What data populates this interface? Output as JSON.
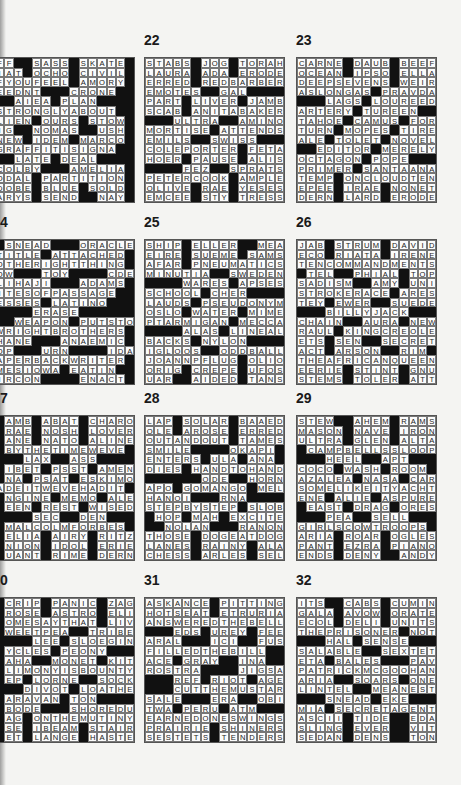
{
  "puzzles": [
    {
      "number": "",
      "num_label": "",
      "x": -6,
      "y": 57,
      "label_x": 2,
      "label_y": 32,
      "rows": [
        "FF##SASS#SKATE",
        "IAT#OCHO#CIVIL",
        "FYOUFEEL#AMORY",
        "EEDNT###CRONE#",
        "##AIEA#PLAN###",
        "STRONGLYABOUT#",
        "LIEN#OURS#STOW",
        "IG##NOMAS##USH",
        "NEW#IDEM#MARCO",
        "GRAFFITISIGNA#",
        "##LATE#DEAL###",
        "COLBY###AMELIA",
        "ODAL#PARTITION",
        "DOBE#BLUE#SOLD",
        "ARYS#SEND##NAY"
      ]
    },
    {
      "number": "22",
      "num_label": "22",
      "x": 144,
      "y": 57,
      "label_x": 144,
      "label_y": 32,
      "rows": [
        "STABS#JOG#TORAH",
        "LAURA#ADA#ERODE",
        "ERRED#REDBARBER",
        "EMOTES##GAL####",
        "PART#LIVER#JAMB",
        "SCAB#ANITABAKER",
        "###ULTRA##AMINO",
        "MORTISE#ATTENDS",
        "EMILS##SWISS###",
        "COLEPORTER#FETA",
        "HOER#PAUSE#ALIS",
        "####FEZ##SPRATS",
        "PETERCOOK#AMPLE",
        "OLIVE#RAE#YESES",
        "EMCEE#STY#TRESS"
      ]
    },
    {
      "number": "23",
      "num_label": "23",
      "x": 296,
      "y": 57,
      "label_x": 296,
      "label_y": 32,
      "rows": [
        "CARNE#DAUB#BEEF",
        "OCEAN#IPSO#ELLA",
        "DEEPSEVENS#WEIR",
        "ASLONGAS#PRAVDA",
        "###LAGS#LOUREED",
        "ARTERY#TUREEN##",
        "TAHOE#CAMUS#FOR",
        "TURN#MOPES#TIRE",
        "ALE#TOLET#NOVEL",
        "##EDITOR#MERELY",
        "OCTAGON#POPE###",
        "PRIMER#SANTAANA",
        "TEMP#ONCLOUDTEN",
        "EPEE#IRAE#NONET",
        "DERN#LARD#ERODE"
      ]
    },
    {
      "number": "24",
      "num_label": "4",
      "x": -6,
      "y": 239,
      "label_x": 0,
      "label_y": 214,
      "rows": [
        "#SNEAD###ORACLE",
        "TITLE#ATTACHED#",
        "OTHERIGHTTHING#",
        "OW###TOY####CDE",
        "LIHAJI###ADAMS#",
        "ITESOFPASSAGE##",
        "ESSES#LATINO###",
        "####ERASE######",
        "##WEAPON#PUTSTO",
        "WRIGHTBROTHERS#",
        "HANE###ANAEMIC#",
        "OP###URN####IDA",
        "APERBACKWRITER#",
        "MESIOWA#EATIN##",
        "IRCON####ENACT#"
      ]
    },
    {
      "number": "25",
      "num_label": "25",
      "x": 144,
      "y": 239,
      "label_x": 144,
      "label_y": 214,
      "rows": [
        "SHIP#ELLER##MEA",
        "EIRE#SUEME#SAMS",
        "AFAR#PNEUMATICS",
        "MINUTIA##SWEDEN",
        "####WARES#APSES",
        "SCHOOL#CHER####",
        "LAUDS#PSEUDONYM",
        "OSLO#WATER#MIME",
        "PTARMIGAN#MECCA",
        "####ALAS#LINEAL",
        "BACKS#NYLON####",
        "IGLOOS##ODDBALL",
        "JOANNPFLUG#OLIO",
        "ORIG#CREPE#UFOS",
        "UAR##AIDED#TANS"
      ]
    },
    {
      "number": "26",
      "num_label": "26",
      "x": 296,
      "y": 239,
      "label_x": 296,
      "label_y": 214,
      "rows": [
        "JAB#STRUM#DAVID",
        "ECO#RIATA#IRENE",
        "TENCOMMANDMENTS",
        "#TEL##PHIAL#TOP",
        "SADISM##AMY#UNI",
        "STROKERACE#ARES",
        "TEY#EWER##SUEDE",
        "###BILLYJACK###",
        "CHAIN##AURA#NEW",
        "RAUL#KINGCREOLE",
        "ETS#SEN##SECRET",
        "ACT#ARSON##RIM#",
        "THEAFRICANQUEEN",
        "EERIE#STINT#GNU",
        "STEMS#TOLER#ATT"
      ]
    },
    {
      "number": "27",
      "num_label": "7",
      "x": -6,
      "y": 415,
      "label_x": 0,
      "label_y": 390,
      "rows": [
        "#AMB#ABAT#CHARO",
        "#RAE#NOSH#LOVER",
        "#ANE#NATO#ALINE",
        "#BYTHETIMEWEVE#",
        "###LAX##ASS####",
        "#IBET#PSST#AMEN",
        "#NA#PSAT#ESKIMO",
        "ADEITWEVEHADIT#",
        "#NGINE#MEMO#ALE",
        "#EEN#REST#WISED",
        "####SEC##DEN###",
        "#MALCOLMFORBES#",
        "#ELIA#AIRY#RITZ",
        "#NION#IDOL#ERIE",
        "#UANT#RIME#DERN"
      ]
    },
    {
      "number": "28",
      "num_label": "28",
      "x": 144,
      "y": 415,
      "label_x": 144,
      "label_y": 390,
      "rows": [
        "LAP#SOLAR#BAAED",
        "OLE#AROSE#ERRED",
        "OUTANDOUT#TAMES",
        "SMILE####OKAPI#",
        "ENTERS#ULA#ANA#",
        "DIES#HANDTOHAND",
        "######ODE##HORNE",
        "APO#GOMANGO#MEL",
        "HANOI###RNA####",
        "STEPBYSTEP#SLOB",
        "#HOP#MAH#EXCITE",
        "##NOLAN###RANON",
        "THOSE#DOGEATDOG",
        "LANES#RAINY#ALA",
        "CHESS#ARLES#SEL"
      ]
    },
    {
      "number": "29",
      "num_label": "29",
      "x": 296,
      "y": 415,
      "label_x": 296,
      "label_y": 390,
      "rows": [
        "STEW##AHEM#RAMS",
        "MASON#NAVE#IRON",
        "ULTRA#GLEN#ALTA",
        "#CAMPBELLSSLOOP",
        "###HEEL##APT###",
        "COCO#WASH#ROOM#",
        "AZALEA#NASA#CAR",
        "SOMELIKEITYACHT",
        "ENE#ALIE#ASPURE",
        "#EAST#DRAG#ORES",
        "###PEA##SELL###",
        "GIRLSCOWTROOPS#",
        "ARIA#ROAR#OGLES",
        "PANT#EZRA#PIANO",
        "ENDS#DENY##ANDY"
      ]
    },
    {
      "number": "30",
      "num_label": "0",
      "x": -6,
      "y": 597,
      "label_x": 0,
      "label_y": 572,
      "rows": [
        "#CRIP#PANIC#ZAG",
        "#ROSE#ASTRO#ELI",
        "#OMESAYTHAT#LIV",
        "#WEETPEA##TRIBE",
        "####LEE#SLOEGIN",
        "#YCLES#PEONY###",
        "#AHA##MONET#KIT",
        "#LIMONYISBOUNTY",
        "#EP#LORNE##SOCK",
        "###DIVOT#LOATHE",
        "#ARAVAN#TON####",
        "#BODE###SHOREDUP",
        "#AG#ONTHEMUTINY",
        "#SE#IBEAM#STAIR",
        "#ET#LANGE#HASTE"
      ]
    },
    {
      "number": "31",
      "num_label": "31",
      "x": 144,
      "y": 597,
      "label_x": 144,
      "label_y": 572,
      "rows": [
        "ASKANCE#PITTING",
        "HOTSEAT#ETRURIA",
        "ANSWEREDTHEBELL",
        "###EDS#UREY#FEE",
        "ARAL###ICI##FUSS",
        "FILLEDTHEBILL##",
        "ACE#GRAY##INA##",
        "ROSTRA####JIGSAW",
        "###REF#RIOT#AGE",
        "###CUTTHEMUSTARD",
        "SALE###ERA##OBIS",
        "TWA#PERU#ATM###",
        "EARNEDONESWINGS",
        "PRAIRIE#SHINERS",
        "SESTETS#TENDERS"
      ]
    },
    {
      "number": "32",
      "num_label": "32",
      "x": 296,
      "y": 597,
      "label_x": 296,
      "label_y": 572,
      "rows": [
        "ITS##CABS#CUMIN",
        "GALA#AVOW#ORATE",
        "ECOL#DELI#UNITS",
        "THEPRISONER#NOT",
        "###HAL#SENSE###",
        "SALABLE##SEXTET",
        "ETA#BALES###PAVE",
        "PATRICKMCGOOHAN",
        "ARIA##SOARS#ONE",
        "LINTEL##MEANEST",
        "###SNEAD#EKE###",
        "MIA#SECRETAGENT",
        "ASCII#TIDE##EDAM",
        "SLING#EVER##VITA",
        "SEDAN#DENS##TON"
      ]
    }
  ],
  "colors": {
    "background": "#f4f4f2",
    "cell_fill": "#fbfbfb",
    "black_square": "#111111",
    "grid_line": "#777777",
    "text": "#222222"
  }
}
